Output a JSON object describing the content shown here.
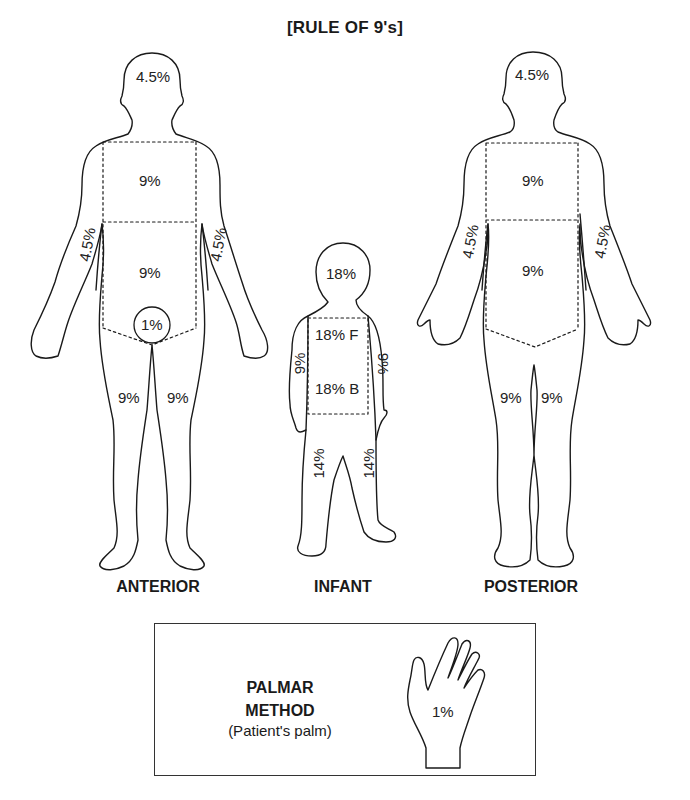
{
  "title": "[RULE OF 9's]",
  "figures": {
    "anterior": {
      "caption": "ANTERIOR",
      "regions": {
        "head": "4.5%",
        "chest": "9%",
        "abdomen": "9%",
        "left_arm": "4.5%",
        "right_arm": "4.5%",
        "genitals": "1%",
        "left_leg": "9%",
        "right_leg": "9%"
      }
    },
    "infant": {
      "caption": "INFANT",
      "regions": {
        "head": "18%",
        "trunk_front": "18% F",
        "trunk_back": "18% B",
        "left_arm": "9%",
        "right_arm": "9%",
        "left_leg": "14%",
        "right_leg": "14%"
      }
    },
    "posterior": {
      "caption": "POSTERIOR",
      "regions": {
        "head": "4.5%",
        "upper_back": "9%",
        "lower_back": "9%",
        "left_arm": "4.5%",
        "right_arm": "4.5%",
        "left_leg": "9%",
        "right_leg": "9%"
      }
    }
  },
  "palmar": {
    "title_line1": "PALMAR",
    "title_line2": "METHOD",
    "subtitle": "(Patient's palm)",
    "hand_value": "1%"
  },
  "colors": {
    "outline": "#1a1a1a",
    "background": "#ffffff"
  }
}
